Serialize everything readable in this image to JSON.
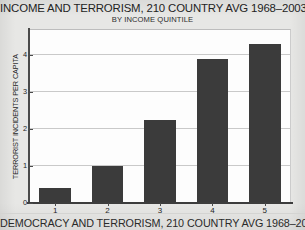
{
  "figure": {
    "title": "INCOME AND TERRORISM, 210 COUNTRY AVG 1968–2003",
    "subtitle": "BY INCOME QUINTILE",
    "next_figure_title_cropped": "DEMOCRACY AND TERRORISM, 210 COUNTRY AVG 1968–20",
    "bar_color": "#3b3b3b",
    "page_background": "#e7e7e5",
    "plot_background": "#fdfdfd",
    "gridline_color": "#c9c9c9"
  },
  "chart_data": {
    "type": "bar",
    "title": "INCOME AND TERRORISM, 210 COUNTRY AVG 1968–2003",
    "subtitle": "BY INCOME QUINTILE",
    "xlabel": "",
    "ylabel": "TERRORIST INCIDENTS PER CAPITA",
    "categories": [
      "1",
      "2",
      "3",
      "4",
      "5"
    ],
    "values": [
      0.4,
      1.0,
      2.25,
      3.9,
      4.3
    ],
    "ylim": [
      0,
      4.7
    ],
    "yticks": [
      0,
      1,
      2,
      3,
      4
    ],
    "ytick_labels": [
      "0",
      "1",
      "2",
      "3",
      "4"
    ],
    "grid": true,
    "grid_axis": "y",
    "legend": false
  }
}
